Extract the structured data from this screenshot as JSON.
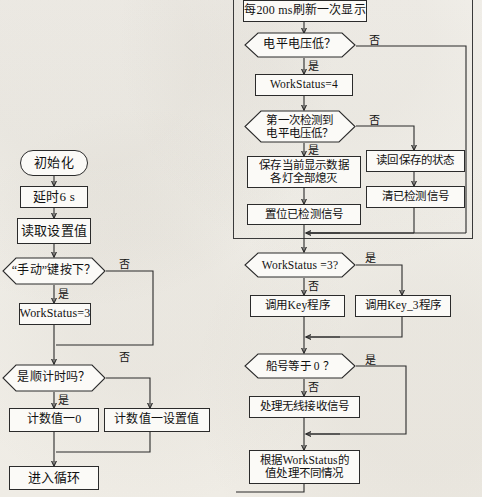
{
  "document": {
    "type": "flowchart",
    "language": "zh-CN",
    "description": "两栏程序流程图：左栏为初始化流程，右栏为主循环处理流程"
  },
  "left_column": {
    "nodes": [
      {
        "id": "init",
        "shape": "terminator",
        "text": "初始化"
      },
      {
        "id": "delay",
        "shape": "process",
        "text": "延时6 s"
      },
      {
        "id": "read_set",
        "shape": "process",
        "text": "读取设置值"
      },
      {
        "id": "manual_key",
        "shape": "decision",
        "text": "“手动”键按下？"
      },
      {
        "id": "ws3",
        "shape": "process",
        "text": "WorkStatus=3"
      },
      {
        "id": "count_up",
        "shape": "decision",
        "text": "是顺计时吗？"
      },
      {
        "id": "cnt_zero",
        "shape": "process",
        "text": "计数值一0"
      },
      {
        "id": "cnt_set",
        "shape": "process",
        "text": "计数值一设置值"
      },
      {
        "id": "enter_loop",
        "shape": "process",
        "text": "进入循环"
      }
    ],
    "branch_labels": {
      "manual_no": "否",
      "manual_yes": "是",
      "count_no": "否",
      "count_yes": "是"
    }
  },
  "right_column": {
    "nodes": [
      {
        "id": "refresh",
        "shape": "process",
        "text": "每200 ms刷新一次显示"
      },
      {
        "id": "level_low",
        "shape": "decision",
        "text": "电平电压低？"
      },
      {
        "id": "ws4",
        "shape": "process",
        "text": "WorkStatus=4"
      },
      {
        "id": "first_detect",
        "shape": "decision",
        "text": "第一次检测到\n电平电压低？"
      },
      {
        "id": "save_data",
        "shape": "process",
        "text": "保存当前显示数据\n各灯全部熄灭"
      },
      {
        "id": "set_flag",
        "shape": "process",
        "text": "置位已检测信号"
      },
      {
        "id": "read_back",
        "shape": "process",
        "text": "读回保存的状态"
      },
      {
        "id": "clear_flag",
        "shape": "process",
        "text": "清已检测信号"
      },
      {
        "id": "ws_is_3",
        "shape": "decision",
        "text": "WorkStatus =3?"
      },
      {
        "id": "call_key",
        "shape": "process",
        "text": "调用Key程序"
      },
      {
        "id": "call_key3",
        "shape": "process",
        "text": "调用Key_3程序"
      },
      {
        "id": "ship_zero",
        "shape": "decision",
        "text": "船号等于 0 ？"
      },
      {
        "id": "wireless",
        "shape": "process",
        "text": "处理无线接收信号"
      },
      {
        "id": "by_ws",
        "shape": "process",
        "text": "根据WorkStatus的\n值处理不同情况"
      }
    ],
    "branch_labels": {
      "level_no": "否",
      "level_yes": "是",
      "first_no": "否",
      "first_yes": "是",
      "ws3_yes": "是",
      "ws3_no": "否",
      "ship_yes": "是",
      "ship_no": "否"
    }
  },
  "colors": {
    "paper": "#f3f1ec",
    "node_fill": "#fbfaf7",
    "stroke": "#2b2b2b",
    "text": "#111111"
  }
}
